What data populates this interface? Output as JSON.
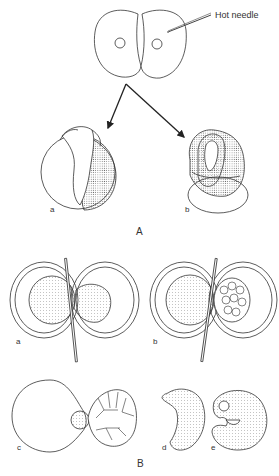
{
  "figure": {
    "panel_A": {
      "label": "A",
      "callout": "Hot needle",
      "sublabels": {
        "a": "a",
        "b": "b"
      }
    },
    "panel_B": {
      "label": "B",
      "sublabels": {
        "a": "a",
        "b": "b",
        "c": "c",
        "d": "d",
        "e": "e"
      }
    },
    "colors": {
      "line": "#333333",
      "stipple": "#555555",
      "background": "#ffffff"
    }
  }
}
